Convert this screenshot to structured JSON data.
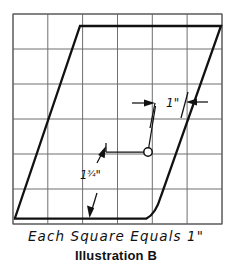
{
  "figure": {
    "title": "Illustration B",
    "scale_note": "Each Square Equals 1\"",
    "grid": {
      "columns": 6,
      "rows": 6,
      "cell_inches": 1,
      "left": 13,
      "top": 14,
      "right": 222,
      "bottom": 224,
      "line_color": "#6f6f6f",
      "border_color": "#5a5a5a"
    },
    "shape": {
      "name": "parallelogram-profile",
      "stroke_color": "#111111",
      "stroke_width": 2.3,
      "description": "Slanted closed profile: steep left diagonal, flat top edge, steep right diagonal with filleted bottom-right corner, flat bottom edge",
      "vertices": [
        {
          "x": 15,
          "y": 218
        },
        {
          "x": 80,
          "y": 26
        },
        {
          "x": 221,
          "y": 26
        },
        {
          "x": 157,
          "y": 206
        },
        {
          "x": 146,
          "y": 219
        },
        {
          "x": 15,
          "y": 219
        }
      ]
    },
    "dimensions": [
      {
        "id": "dim-top",
        "label": "1\"",
        "value": "1",
        "unit": "inch",
        "label_x": 166,
        "label_y": 96,
        "arrow_left_tip_x": 152,
        "arrow_right_tip_x": 206,
        "arrow_y": 103
      },
      {
        "id": "dim-bottom",
        "label": "1¾\"",
        "whole": "1",
        "fraction": "3/4",
        "value": "1.75",
        "unit": "inch",
        "label_x": 80,
        "label_y": 168,
        "arrow_tip_x": 104,
        "arrow_tip_y": 150
      }
    ],
    "leader": {
      "name": "leader-with-node",
      "node_x": 148,
      "node_y": 152,
      "node_radius": 4.2,
      "horizontal_start_x": 106,
      "elbow_tick_y": 143,
      "diagonal_end_x": 155,
      "diagonal_end_y": 104
    },
    "extra_arrow": {
      "name": "bottom-edge-arrow",
      "tip_x": 90,
      "tip_y": 217,
      "tail_x": 97,
      "tail_y": 196
    }
  }
}
